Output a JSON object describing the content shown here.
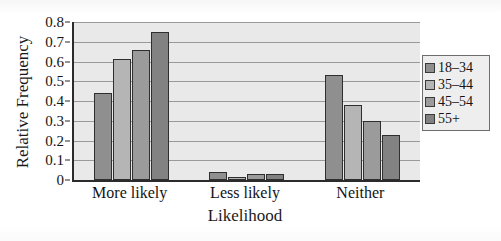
{
  "chart_data": {
    "type": "bar",
    "title": "",
    "xlabel": "Likelihood",
    "ylabel": "Relative Frequency",
    "categories": [
      "More likely",
      "Less likely",
      "Neither"
    ],
    "ylim": [
      0,
      0.8
    ],
    "ytick_labels": [
      "0",
      "0.1",
      "0.2",
      "0.3",
      "0.4",
      "0.5",
      "0.6",
      "0.7",
      "0.8"
    ],
    "ytick_values": [
      0,
      0.1,
      0.2,
      0.3,
      0.4,
      0.5,
      0.6,
      0.7,
      0.8
    ],
    "grid": true,
    "legend_position": "right",
    "series": [
      {
        "name": "18–34",
        "color": "#8f8f8f",
        "values": [
          0.44,
          0.04,
          0.53
        ]
      },
      {
        "name": "35–44",
        "color": "#b5b5b5",
        "values": [
          0.615,
          0.01,
          0.38
        ]
      },
      {
        "name": "45–54",
        "color": "#9b9b9b",
        "values": [
          0.66,
          0.03,
          0.3
        ]
      },
      {
        "name": "55+",
        "color": "#828282",
        "values": [
          0.75,
          0.03,
          0.23
        ]
      }
    ]
  },
  "style": {
    "plot_background": "#e9e9e9",
    "gridline_color": "#9a9a9a",
    "axis_color": "#2b2b2b",
    "bar_outline": "#2f2f2f",
    "legend_background": "#eeeeee",
    "legend_border": "#6d6d6d",
    "text_color": "#141414"
  }
}
